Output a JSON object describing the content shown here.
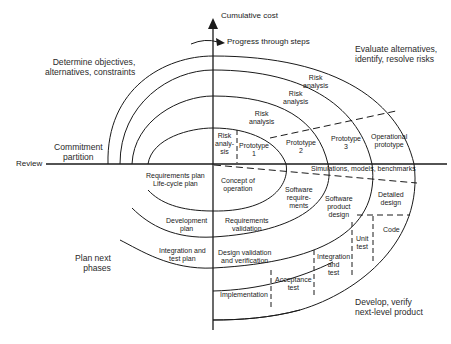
{
  "axes": {
    "vertical_label": "Cumulative cost",
    "horizontal_label": "Review",
    "progress_label": "Progress through steps"
  },
  "quadrants": {
    "top_left": "Determine objectives,\nalternatives, constraints",
    "top_right": "Evaluate alternatives,\nidentify, resolve risks",
    "bottom_left": "Plan next\nphases",
    "bottom_right": "Develop, verify\nnext-level product"
  },
  "commitment": "Commitment\npartition",
  "risk_analysis": [
    "Risk\nanaly-\nsis",
    "Risk\nanalysis",
    "Risk\nanalysis",
    "Risk\nanalysis"
  ],
  "prototypes": [
    "Prototype\n1",
    "Prototype\n2",
    "Prototype\n3",
    "Operational\nprototype"
  ],
  "simulations": "Simulations, models, benchmarks",
  "plans": [
    "Requirements plan\nLife-cycle plan",
    "Development\nplan",
    "Integration and\ntest plan"
  ],
  "develop_steps": [
    "Concept of\noperation",
    "Software\nrequire-\nments",
    "Software\nproduct\ndesign",
    "Detailed\ndesign",
    "Code",
    "Unit\ntest",
    "Integration\nand\ntest",
    "Acceptance\ntest",
    "Implementation"
  ],
  "validation": [
    "Requirements\nvalidation",
    "Design validation\nand verification"
  ],
  "colors": {
    "line": "#1a1a1a",
    "text": "#1a1a1a",
    "background": "#ffffff"
  }
}
